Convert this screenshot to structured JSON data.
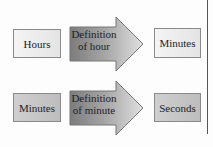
{
  "rows": [
    {
      "from": "Hours",
      "conversion": [
        "Definition",
        "of hour"
      ],
      "to": "Minutes"
    },
    {
      "from": "Minutes",
      "conversion": [
        "Definition",
        "of minute"
      ],
      "to": "Seconds"
    }
  ]
}
